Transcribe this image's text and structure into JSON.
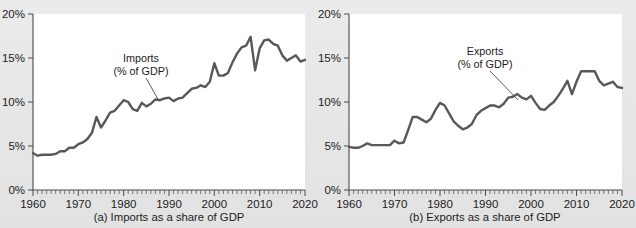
{
  "figure": {
    "background_color": "#e8e8e8",
    "line_color": "#585858",
    "axis_color": "#4a4a4a"
  },
  "chart_data": [
    {
      "type": "line",
      "panel_id": "a",
      "title": "",
      "caption": "(a) Imports as a share of GDP",
      "annotation": {
        "line1": "Imports",
        "line2": "(% of GDP)"
      },
      "xlabel": "",
      "ylabel": "",
      "xlim": [
        1960,
        2020
      ],
      "ylim": [
        0,
        20
      ],
      "grid": false,
      "ytick_labels": [
        "0%",
        "5%",
        "10%",
        "15%",
        "20%"
      ],
      "ytick_values": [
        0,
        5,
        10,
        15,
        20
      ],
      "xtick_labels": [
        "1960",
        "1970",
        "1980",
        "1990",
        "2000",
        "2010",
        "2020"
      ],
      "xtick_values": [
        1960,
        1970,
        1980,
        1990,
        2000,
        2010,
        2020
      ],
      "minor_tick_interval": 1,
      "series": [
        {
          "name": "Imports (% of GDP)",
          "x": [
            1960,
            1961,
            1962,
            1963,
            1964,
            1965,
            1966,
            1967,
            1968,
            1969,
            1970,
            1971,
            1972,
            1973,
            1974,
            1975,
            1976,
            1977,
            1978,
            1979,
            1980,
            1981,
            1982,
            1983,
            1984,
            1985,
            1986,
            1987,
            1988,
            1989,
            1990,
            1991,
            1992,
            1993,
            1994,
            1995,
            1996,
            1997,
            1998,
            1999,
            2000,
            2001,
            2002,
            2003,
            2004,
            2005,
            2006,
            2007,
            2008,
            2009,
            2010,
            2011,
            2012,
            2013,
            2014,
            2015,
            2016,
            2017,
            2018,
            2019,
            2020
          ],
          "values": [
            4.2,
            3.9,
            4.0,
            4.0,
            4.0,
            4.1,
            4.4,
            4.4,
            4.8,
            4.8,
            5.2,
            5.4,
            5.8,
            6.5,
            8.3,
            7.1,
            7.9,
            8.8,
            9.0,
            9.6,
            10.2,
            10.0,
            9.2,
            9.0,
            9.9,
            9.5,
            9.8,
            10.3,
            10.2,
            10.4,
            10.5,
            10.1,
            10.4,
            10.5,
            11.0,
            11.5,
            11.6,
            11.9,
            11.7,
            12.3,
            14.4,
            13.0,
            13.0,
            13.3,
            14.5,
            15.5,
            16.2,
            16.4,
            17.4,
            13.6,
            16.1,
            17.0,
            17.1,
            16.6,
            16.4,
            15.3,
            14.7,
            15.0,
            15.3,
            14.6,
            14.8
          ]
        }
      ]
    },
    {
      "type": "line",
      "panel_id": "b",
      "title": "",
      "caption": "(b) Exports as a share of GDP",
      "annotation": {
        "line1": "Exports",
        "line2": "(% of GDP)"
      },
      "xlabel": "",
      "ylabel": "",
      "xlim": [
        1960,
        2020
      ],
      "ylim": [
        0,
        20
      ],
      "grid": false,
      "ytick_labels": [
        "0%",
        "5%",
        "10%",
        "15%",
        "20%"
      ],
      "ytick_values": [
        0,
        5,
        10,
        15,
        20
      ],
      "xtick_labels": [
        "1960",
        "1970",
        "1980",
        "1990",
        "2000",
        "2010",
        "2020"
      ],
      "xtick_values": [
        1960,
        1970,
        1980,
        1990,
        2000,
        2010,
        2020
      ],
      "minor_tick_interval": 1,
      "series": [
        {
          "name": "Exports (% of GDP)",
          "x": [
            1960,
            1961,
            1962,
            1963,
            1964,
            1965,
            1966,
            1967,
            1968,
            1969,
            1970,
            1971,
            1972,
            1973,
            1974,
            1975,
            1976,
            1977,
            1978,
            1979,
            1980,
            1981,
            1982,
            1983,
            1984,
            1985,
            1986,
            1987,
            1988,
            1989,
            1990,
            1991,
            1992,
            1993,
            1994,
            1995,
            1996,
            1997,
            1998,
            1999,
            2000,
            2001,
            2002,
            2003,
            2004,
            2005,
            2006,
            2007,
            2008,
            2009,
            2010,
            2011,
            2012,
            2013,
            2014,
            2015,
            2016,
            2017,
            2018,
            2019,
            2020
          ],
          "values": [
            4.9,
            4.8,
            4.8,
            5.0,
            5.3,
            5.1,
            5.1,
            5.1,
            5.1,
            5.1,
            5.6,
            5.3,
            5.4,
            6.8,
            8.3,
            8.3,
            8.0,
            7.7,
            8.1,
            9.1,
            9.9,
            9.6,
            8.7,
            7.8,
            7.3,
            6.9,
            7.1,
            7.5,
            8.5,
            9.0,
            9.3,
            9.6,
            9.6,
            9.4,
            9.8,
            10.5,
            10.6,
            10.9,
            10.5,
            10.3,
            10.7,
            9.9,
            9.2,
            9.1,
            9.6,
            10.0,
            10.7,
            11.5,
            12.4,
            10.9,
            12.3,
            13.5,
            13.5,
            13.5,
            13.5,
            12.4,
            11.9,
            12.1,
            12.3,
            11.7,
            11.6
          ]
        }
      ]
    }
  ]
}
